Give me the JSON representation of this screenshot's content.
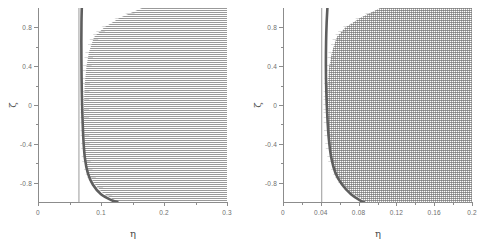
{
  "figure": {
    "background": "#ffffff",
    "curve_color": "#5e5e5e",
    "vline_color": "#9a9a9a",
    "axis_color": "#8c8c8c",
    "stipple_color": "#787878"
  },
  "chart_data": [
    {
      "type": "scatter",
      "panel": "left",
      "title": "",
      "xlabel": "η",
      "ylabel": "ζ",
      "xlim": [
        0,
        0.3
      ],
      "ylim": [
        -1.0,
        1.0
      ],
      "xticks": [
        0,
        0.1,
        0.2,
        0.3
      ],
      "xticklabels": [
        "0",
        "0.1",
        "0.2",
        "0.3"
      ],
      "xminorticks": [
        0.05,
        0.15,
        0.25
      ],
      "yticks": [
        -0.8,
        -0.4,
        0,
        0.4,
        0.8
      ],
      "yticklabels": [
        "-0.8",
        "-0.4",
        "0",
        "0.4",
        "0.8"
      ],
      "yminorticks": [
        -0.6,
        -0.2,
        0.2,
        0.6
      ],
      "grid": false,
      "legend": null,
      "series": [
        {
          "name": "stippled-region",
          "style": "horizontal-line-hatch",
          "description": "Dense horizontally-striped shaded region filling the right portion of the axes; its left boundary is a curve that bulges leftward near ζ=0 and retreats rightward toward ζ=±1.",
          "boundary_x": [
            0.125,
            0.102,
            0.088,
            0.08,
            0.076,
            0.074,
            0.073,
            0.073,
            0.074,
            0.077,
            0.081,
            0.089,
            0.105,
            0.13,
            0.165
          ],
          "boundary_zeta": [
            -1.0,
            -0.9,
            -0.8,
            -0.7,
            -0.6,
            -0.45,
            -0.25,
            0.0,
            0.2,
            0.4,
            0.55,
            0.7,
            0.8,
            0.9,
            1.0
          ]
        },
        {
          "name": "vertical-line",
          "style": "thin-solid",
          "description": "Thin vertical reference line",
          "x_value": 0.065
        },
        {
          "name": "thick-curve",
          "style": "thick-solid",
          "description": "Thick dark curve, nearly vertical for most of ζ, bending to larger η at the bottom.",
          "x": [
            0.0695,
            0.069,
            0.0688,
            0.069,
            0.0695,
            0.0705,
            0.072,
            0.0745,
            0.079,
            0.087,
            0.1,
            0.118,
            0.126
          ],
          "zeta": [
            1.0,
            0.85,
            0.65,
            0.4,
            0.15,
            -0.1,
            -0.35,
            -0.55,
            -0.7,
            -0.82,
            -0.92,
            -0.985,
            -1.0
          ]
        }
      ]
    },
    {
      "type": "scatter",
      "panel": "right",
      "title": "",
      "xlabel": "η",
      "ylabel": "ζ",
      "xlim": [
        0,
        0.2
      ],
      "ylim": [
        -1.0,
        1.0
      ],
      "xticks": [
        0,
        0.04,
        0.08,
        0.12,
        0.16,
        0.2
      ],
      "xticklabels": [
        "0",
        "0.04",
        "0.08",
        "0.12",
        "0.16",
        "0.2"
      ],
      "xminorticks": [
        0.02,
        0.06,
        0.1,
        0.14,
        0.18
      ],
      "yticks": [
        -0.8,
        -0.4,
        0,
        0.4,
        0.8
      ],
      "yticklabels": [
        "-0.8",
        "-0.4",
        "0",
        "0.4",
        "0.8"
      ],
      "yminorticks": [
        -0.6,
        -0.2,
        0.2,
        0.6
      ],
      "grid": false,
      "legend": null,
      "series": [
        {
          "name": "stippled-region",
          "style": "dot-grid-hatch",
          "description": "Dot-grid shaded region filling the right portion of the axes; left boundary bulges leftward near ζ=0.2 and retreats rightward toward ζ=±1.",
          "boundary_x": [
            0.088,
            0.072,
            0.062,
            0.056,
            0.052,
            0.049,
            0.047,
            0.0465,
            0.047,
            0.049,
            0.052,
            0.057,
            0.066,
            0.082,
            0.103
          ],
          "boundary_zeta": [
            -1.0,
            -0.9,
            -0.8,
            -0.7,
            -0.6,
            -0.45,
            -0.25,
            0.0,
            0.2,
            0.4,
            0.55,
            0.7,
            0.8,
            0.9,
            1.0
          ]
        },
        {
          "name": "vertical-line",
          "style": "thin-solid",
          "description": "Thin vertical reference line",
          "x_value": 0.041
        },
        {
          "name": "thick-curve",
          "style": "thick-solid",
          "description": "Thick dark curve, nearly vertical for most of ζ, bending to larger η at the bottom.",
          "x": [
            0.047,
            0.0462,
            0.0456,
            0.0454,
            0.0458,
            0.0468,
            0.0485,
            0.0512,
            0.0555,
            0.0625,
            0.072,
            0.082,
            0.0855
          ],
          "zeta": [
            1.0,
            0.85,
            0.65,
            0.4,
            0.15,
            -0.1,
            -0.35,
            -0.55,
            -0.7,
            -0.82,
            -0.92,
            -0.985,
            -1.0
          ]
        }
      ]
    }
  ]
}
